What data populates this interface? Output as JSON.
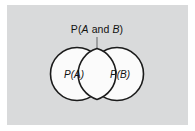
{
  "figure": {
    "type": "venn-diagram",
    "title": "",
    "panel": {
      "background_color": "#d9dadb",
      "outer_background_color": "#ffffff",
      "x": 7,
      "y": 5,
      "width": 181,
      "height": 120
    },
    "callout": {
      "label_full": "P(A and B)",
      "label_prefix": "P(",
      "label_italic_a": "A",
      "label_connector": " and ",
      "label_italic_b": "B",
      "label_suffix": ")",
      "leader_color": "#7d7f81"
    },
    "circles": [
      {
        "name": "set-a",
        "label": "P(A)",
        "label_prefix": "P(",
        "label_italic": "A",
        "label_suffix": ")",
        "cx": 77,
        "cy": 74,
        "r": 26.5,
        "fill": "#fbfbfb",
        "stroke": "#1b1b1b"
      },
      {
        "name": "set-b",
        "label": "P(B)",
        "label_prefix": "P(",
        "label_italic": "B",
        "label_suffix": ")",
        "cx": 117,
        "cy": 74,
        "r": 26.5,
        "fill": "#fbfbfb",
        "stroke": "#1b1b1b"
      }
    ]
  }
}
